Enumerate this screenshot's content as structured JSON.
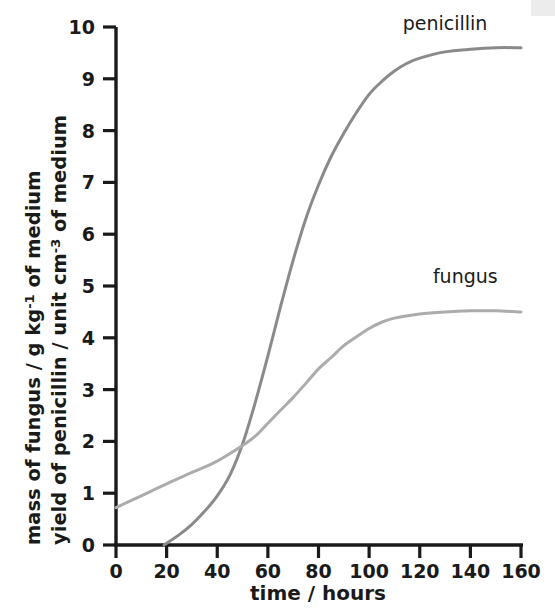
{
  "chart_data": {
    "type": "line",
    "title": "",
    "xlabel": "time / hours",
    "ylabel_line1": "mass of fungus / g kg",
    "ylabel_line1_sup": "-1",
    "ylabel_line1_tail": " of medium",
    "ylabel_line2": "yield of penicillin / unit cm",
    "ylabel_line2_sup": "-3",
    "ylabel_line2_tail": " of medium",
    "xlim": [
      0,
      160
    ],
    "ylim": [
      0,
      10
    ],
    "xticks": [
      "0",
      "20",
      "40",
      "60",
      "80",
      "100",
      "120",
      "140",
      "160"
    ],
    "xtick_values": [
      0,
      20,
      40,
      60,
      80,
      100,
      120,
      140,
      160
    ],
    "yticks": [
      "0",
      "1",
      "2",
      "3",
      "4",
      "5",
      "6",
      "7",
      "8",
      "9",
      "10"
    ],
    "ytick_values": [
      0,
      1,
      2,
      3,
      4,
      5,
      6,
      7,
      8,
      9,
      10
    ],
    "grid": false,
    "legend_position": "inline-annotations",
    "annotations": [
      {
        "name": "penicillin",
        "label": "penicillin",
        "x": 130,
        "y": 9.95
      },
      {
        "name": "fungus",
        "label": "fungus",
        "x": 138,
        "y": 5.05
      }
    ],
    "series": [
      {
        "name": "penicillin",
        "label": "penicillin",
        "color": "#8a8a8a",
        "linewidth": 3.0,
        "x": [
          19,
          25,
          30,
          35,
          40,
          45,
          50,
          55,
          60,
          65,
          70,
          75,
          80,
          85,
          90,
          95,
          100,
          105,
          110,
          115,
          120,
          130,
          140,
          150,
          160
        ],
        "y": [
          0.0,
          0.2,
          0.4,
          0.65,
          0.95,
          1.35,
          1.95,
          2.75,
          3.65,
          4.6,
          5.5,
          6.3,
          6.95,
          7.5,
          7.95,
          8.35,
          8.7,
          8.95,
          9.15,
          9.3,
          9.4,
          9.52,
          9.57,
          9.6,
          9.6
        ]
      },
      {
        "name": "fungus",
        "label": "fungus",
        "color": "#acacac",
        "linewidth": 3.0,
        "x": [
          0,
          10,
          20,
          30,
          40,
          50,
          55,
          60,
          65,
          70,
          75,
          80,
          85,
          90,
          95,
          100,
          105,
          110,
          120,
          130,
          140,
          150,
          160
        ],
        "y": [
          0.72,
          0.95,
          1.18,
          1.4,
          1.62,
          1.92,
          2.1,
          2.35,
          2.6,
          2.85,
          3.12,
          3.4,
          3.62,
          3.85,
          4.02,
          4.18,
          4.3,
          4.38,
          4.46,
          4.5,
          4.52,
          4.52,
          4.5
        ]
      }
    ],
    "axis_color": "#1a1a1a",
    "background": "#ffffff"
  }
}
